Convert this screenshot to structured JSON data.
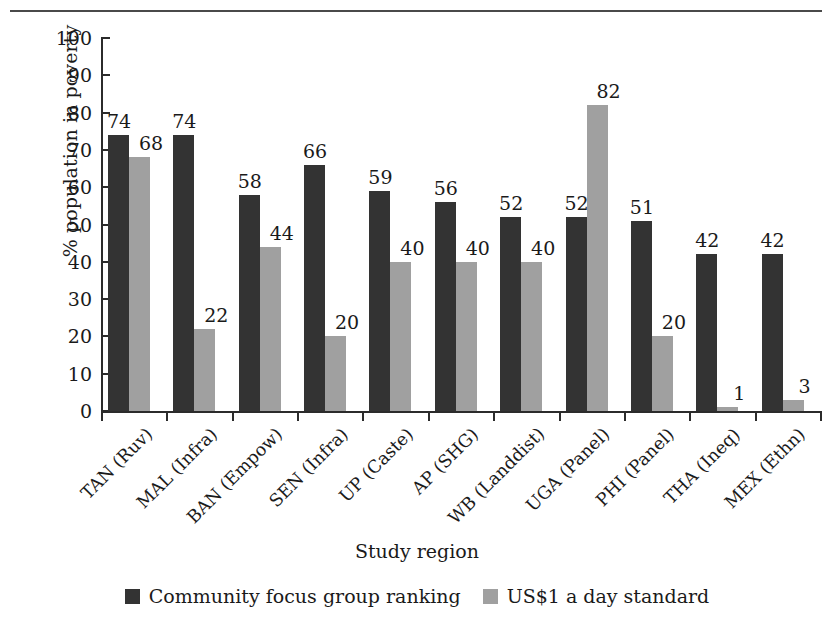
{
  "figure": {
    "top_rule": true
  },
  "chart_data": {
    "type": "bar",
    "title": "",
    "xlabel": "Study region",
    "ylabel": "% population in poverty",
    "ylim": [
      0,
      100
    ],
    "ytick_step": 10,
    "yticks": [
      100,
      90,
      80,
      70,
      60,
      50,
      40,
      30,
      20,
      10,
      0
    ],
    "grid": false,
    "legend_position": "bottom-center",
    "categories": [
      "TAN (Ruv)",
      "MAL (Infra)",
      "BAN (Empow)",
      "SEN (Infra)",
      "UP (Caste)",
      "AP (SHG)",
      "WB (Landdist)",
      "UGA (Panel)",
      "PHI (Panel)",
      "THA (Ineq)",
      "MEX (Ethn)"
    ],
    "series": [
      {
        "name": "Community focus group ranking",
        "color": "#333333",
        "values": [
          74,
          74,
          58,
          66,
          59,
          56,
          52,
          52,
          51,
          42,
          42
        ]
      },
      {
        "name": "US$1 a day standard",
        "color": "#a0a0a0",
        "values": [
          68,
          22,
          44,
          20,
          40,
          40,
          40,
          82,
          20,
          1,
          3
        ]
      }
    ],
    "data_labels": [
      {
        "category": "TAN (Ruv)",
        "dark": "74",
        "light": "68"
      },
      {
        "category": "MAL (Infra)",
        "dark": "74",
        "light": "22"
      },
      {
        "category": "BAN (Empow)",
        "dark": "58",
        "light": "44"
      },
      {
        "category": "SEN (Infra)",
        "dark": "66",
        "light": "20"
      },
      {
        "category": "UP (Caste)",
        "dark": "59",
        "light": "40"
      },
      {
        "category": "AP (SHG)",
        "dark": "56",
        "light": "40"
      },
      {
        "category": "WB (Landdist)",
        "dark": "52",
        "light": "40"
      },
      {
        "category": "UGA (Panel)",
        "dark": "52",
        "light": "82"
      },
      {
        "category": "PHI (Panel)",
        "dark": "51",
        "light": "20"
      },
      {
        "category": "THA (Ineq)",
        "dark": "42",
        "light": "1"
      },
      {
        "category": "MEX (Ethn)",
        "dark": "42",
        "light": "3"
      }
    ]
  },
  "legend": [
    {
      "label": "Community focus group ranking",
      "color": "#333333"
    },
    {
      "label": "US$1 a day standard",
      "color": "#a0a0a0"
    }
  ]
}
